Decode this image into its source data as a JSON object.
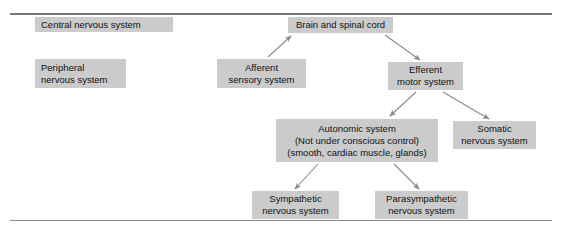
{
  "figure": {
    "background_color": "#ffffff",
    "box_fill_color": "#cbcbcb",
    "text_color": "#111111",
    "arrow_color": "#8b8b8b",
    "rule_color": "#777777"
  },
  "rules": {
    "top_label": "top-divider-rule",
    "bottom_label": "bottom-divider-rule"
  },
  "boxes": {
    "central_nervous_system": {
      "lines": [
        "Central nervous system"
      ]
    },
    "peripheral_nervous_system": {
      "lines": [
        "Peripheral",
        "nervous system"
      ]
    },
    "brain_and_spinal_cord": {
      "lines": [
        "Brain and spinal cord"
      ]
    },
    "afferent_sensory_system": {
      "lines": [
        "Afferent",
        "sensory system"
      ]
    },
    "efferent_motor_system": {
      "lines": [
        "Efferent",
        "motor system"
      ]
    },
    "autonomic_system": {
      "lines": [
        "Autonomic system",
        "(Not under conscious control)",
        "(smooth, cardiac muscle, glands)"
      ]
    },
    "somatic_nervous_system": {
      "lines": [
        "Somatic",
        "nervous system"
      ]
    },
    "sympathetic_nervous_system": {
      "lines": [
        "Sympathetic",
        "nervous system"
      ]
    },
    "parasympathetic_nervous_system": {
      "lines": [
        "Parasympathetic",
        "nervous system"
      ]
    }
  },
  "arrows": [
    {
      "name": "afferent-to-brain",
      "from": "afferent_sensory_system",
      "to": "brain_and_spinal_cord"
    },
    {
      "name": "brain-to-efferent",
      "from": "brain_and_spinal_cord",
      "to": "efferent_motor_system"
    },
    {
      "name": "efferent-to-autonomic",
      "from": "efferent_motor_system",
      "to": "autonomic_system"
    },
    {
      "name": "efferent-to-somatic",
      "from": "efferent_motor_system",
      "to": "somatic_nervous_system"
    },
    {
      "name": "autonomic-to-sympathetic",
      "from": "autonomic_system",
      "to": "sympathetic_nervous_system"
    },
    {
      "name": "autonomic-to-parasympathetic",
      "from": "autonomic_system",
      "to": "parasympathetic_nervous_system"
    }
  ]
}
